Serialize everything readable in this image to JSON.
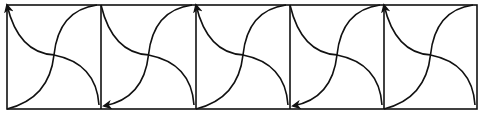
{
  "diagram": {
    "width": 483,
    "height": 115,
    "stroke_color": "#111111",
    "frame": {
      "left": 7,
      "top": 5,
      "right": 477,
      "bottom": 109
    },
    "dividers_x": [
      101,
      196,
      290,
      384
    ],
    "tiles": [
      {
        "index": 1,
        "arrow": "top-left"
      },
      {
        "index": 2,
        "arrow": "bottom-left"
      },
      {
        "index": 3,
        "arrow": "top-left"
      },
      {
        "index": 4,
        "arrow": "bottom-left"
      },
      {
        "index": 5,
        "arrow": "top-left"
      }
    ]
  }
}
